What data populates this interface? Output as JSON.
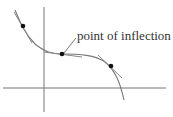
{
  "diagram": {
    "annotation": "point of inflection",
    "colors": {
      "curve": "#777777",
      "tangent": "#888888",
      "axis": "#777777",
      "point": "#111111",
      "text": "#333333"
    },
    "points": [
      {
        "name": "left-point",
        "role": "concave up"
      },
      {
        "name": "inflection-point",
        "role": "point of inflection"
      },
      {
        "name": "right-point",
        "role": "concave down"
      }
    ]
  }
}
